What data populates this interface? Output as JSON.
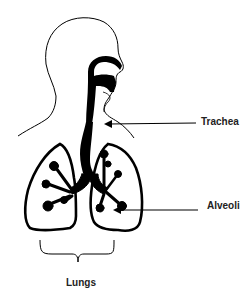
{
  "diagram": {
    "labels": {
      "trachea": "Trachea",
      "alveoli": "Alveoli",
      "lungs": "Lungs"
    },
    "colors": {
      "ink": "#000000",
      "background": "#ffffff",
      "label_text": "#222222"
    }
  }
}
